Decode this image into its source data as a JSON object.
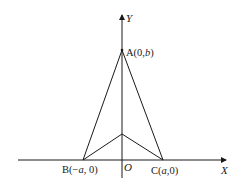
{
  "diagram": {
    "axes": {
      "x_label": "X",
      "y_label": "Y",
      "origin_label": "O"
    },
    "points": {
      "A": {
        "label_prefix": "A(0,",
        "label_var": "b",
        "label_suffix": ")"
      },
      "B": {
        "label_prefix": "B(−",
        "label_var": "a",
        "label_suffix": ", 0)"
      },
      "C": {
        "label_prefix": "C(",
        "label_var": "a",
        "label_suffix": ",0)"
      }
    },
    "colors": {
      "stroke": "#1a1a1a",
      "background": "#ffffff"
    }
  }
}
